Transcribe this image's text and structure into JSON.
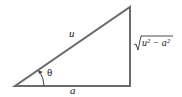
{
  "diagram": {
    "type": "right-triangle",
    "line_color": "#6b6b6b",
    "labels": {
      "hypotenuse": "u",
      "base": "a",
      "vertical_radicand": "u² − a²",
      "angle": "θ"
    }
  }
}
